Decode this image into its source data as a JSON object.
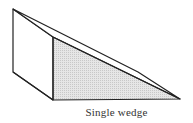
{
  "figure": {
    "caption": "Single wedge",
    "shape": "single-wedge",
    "colors": {
      "stroke": "#222222",
      "shade": "#d9d9d9",
      "background": "#ffffff"
    }
  }
}
